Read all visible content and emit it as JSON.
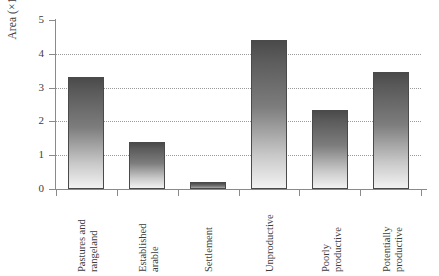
{
  "chart_data": {
    "type": "bar",
    "title": "",
    "xlabel": "",
    "ylabel": "Area (×10⁹ hectares)",
    "ylabel_base": "Area (×10",
    "ylabel_exp": "9",
    "ylabel_tail": " hectares)",
    "categories": [
      "Pastures and rangeland",
      "Established arable",
      "Settlement",
      "Unproductive",
      "Poorly productive",
      "Potentially productive"
    ],
    "category_lines": [
      [
        "Pastures and",
        "rangeland"
      ],
      [
        "Established",
        "arable"
      ],
      [
        "Settlement",
        ""
      ],
      [
        "Unproductive",
        ""
      ],
      [
        "Poorly",
        "productive"
      ],
      [
        "Potentially",
        "productive"
      ]
    ],
    "values": [
      3.3,
      1.4,
      0.2,
      4.4,
      2.35,
      3.45
    ],
    "ylim": [
      0,
      5
    ],
    "yticks": [
      "0",
      "1",
      "2",
      "3",
      "4",
      "5"
    ],
    "ytick_values": [
      0,
      1,
      2,
      3,
      4,
      5
    ],
    "gridlines_at": [
      1,
      2,
      3,
      4,
      5
    ],
    "grid": true,
    "grid_style": "dotted",
    "legend": "none",
    "bar_fill": "#6e6e6e",
    "bar_gradient_top": "#4a4a4a",
    "bar_gradient_bottom": "#f2f2f2",
    "bar_border": "#4a4a4a",
    "axis_color": "#8a8a8a",
    "grid_color": "#9a9a9a",
    "text_color": "#3c3c3c",
    "background": "#ffffff"
  }
}
